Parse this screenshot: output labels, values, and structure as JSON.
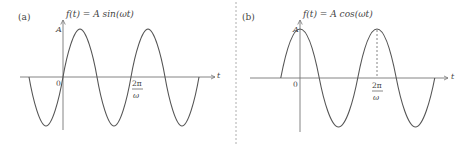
{
  "panels": [
    {
      "id": "a",
      "tag": "(a)",
      "formula": "f(t) = A sin(ωt)",
      "y_axis_label": "A",
      "x_axis_label": "t",
      "origin_label": "0",
      "tick_label_num": "2π",
      "tick_label_den": "ω"
    },
    {
      "id": "b",
      "tag": "(b)",
      "formula": "f(t) = A cos(ωt)",
      "y_axis_label": "A",
      "x_axis_label": "t",
      "origin_label": "0",
      "tick_label_num": "2π",
      "tick_label_den": "ω"
    }
  ],
  "colors": {
    "curve": "#555555",
    "axis": "#777777",
    "divider": "#999999"
  }
}
